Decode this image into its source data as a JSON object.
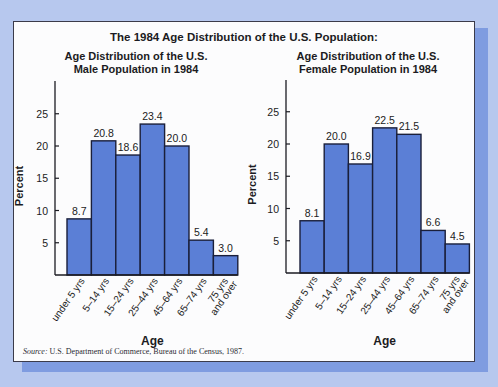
{
  "title": "The 1984 Age Distribution of the U.S. Population:",
  "source_label": "Source:",
  "source_text": " U.S. Department of Commerce, Bureau of the Census, 1987.",
  "colors": {
    "bar": "#5b7fd6",
    "bar_border": "#1a1f3a",
    "background": "#b7c8ee",
    "shadow": "#7f9ce0"
  },
  "chart_data": [
    {
      "type": "bar",
      "title": "Age Distribution of the U.S. Male Population in 1984",
      "title_lines": [
        "Age Distribution of the U.S.",
        "Male Population in 1984"
      ],
      "xlabel": "Age",
      "ylabel": "Percent",
      "yticks": [
        5,
        10,
        15,
        20,
        25
      ],
      "ylim": [
        0,
        28
      ],
      "categories": [
        "under 5 yrs",
        "5–14 yrs",
        "15–24 yrs",
        "25–44 yrs",
        "45–64 yrs",
        "65–74 yrs",
        "75 yrs and over"
      ],
      "values": [
        8.7,
        20.8,
        18.6,
        23.4,
        20.0,
        5.4,
        3.0
      ],
      "value_labels": [
        "8.7",
        "20.8",
        "18.6",
        "23.4",
        "20.0",
        "5.4",
        "3.0"
      ],
      "grid": false,
      "legend": null
    },
    {
      "type": "bar",
      "title": "Age Distribution of the U.S. Female Population in 1984",
      "title_lines": [
        "Age Distribution of the U.S.",
        "Female Population in 1984"
      ],
      "xlabel": "Age",
      "ylabel": "Percent",
      "yticks": [
        5,
        10,
        15,
        20,
        25
      ],
      "ylim": [
        0,
        28
      ],
      "categories": [
        "under 5 yrs",
        "5–14 yrs",
        "15–24 yrs",
        "25–44 yrs",
        "45–64 yrs",
        "65–74 yrs",
        "75 yrs and over"
      ],
      "values": [
        8.1,
        20.0,
        16.9,
        22.5,
        21.5,
        6.6,
        4.5
      ],
      "value_labels": [
        "8.1",
        "20.0",
        "16.9",
        "22.5",
        "21.5",
        "6.6",
        "4.5"
      ],
      "grid": false,
      "legend": null
    }
  ]
}
